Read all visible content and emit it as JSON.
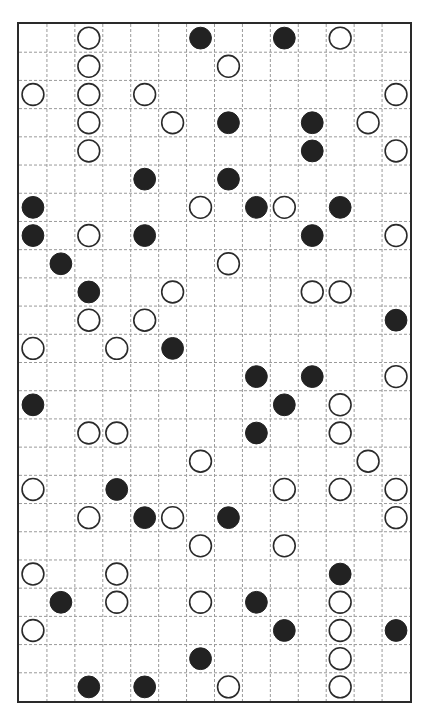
{
  "puzzle": {
    "type": "masyu",
    "rows": 24,
    "cols": 14,
    "colors": {
      "black": "#222222",
      "white": "#ffffff",
      "outline": "#2a2a2a",
      "grid": "#9a9a9a"
    },
    "circles": [
      {
        "row": 0,
        "col": 2,
        "color": "white"
      },
      {
        "row": 0,
        "col": 6,
        "color": "black"
      },
      {
        "row": 0,
        "col": 9,
        "color": "black"
      },
      {
        "row": 0,
        "col": 11,
        "color": "white"
      },
      {
        "row": 1,
        "col": 2,
        "color": "white"
      },
      {
        "row": 1,
        "col": 7,
        "color": "white"
      },
      {
        "row": 2,
        "col": 0,
        "color": "white"
      },
      {
        "row": 2,
        "col": 2,
        "color": "white"
      },
      {
        "row": 2,
        "col": 4,
        "color": "white"
      },
      {
        "row": 2,
        "col": 13,
        "color": "white"
      },
      {
        "row": 3,
        "col": 2,
        "color": "white"
      },
      {
        "row": 3,
        "col": 5,
        "color": "white"
      },
      {
        "row": 3,
        "col": 7,
        "color": "black"
      },
      {
        "row": 3,
        "col": 10,
        "color": "black"
      },
      {
        "row": 3,
        "col": 12,
        "color": "white"
      },
      {
        "row": 4,
        "col": 2,
        "color": "white"
      },
      {
        "row": 4,
        "col": 10,
        "color": "black"
      },
      {
        "row": 4,
        "col": 13,
        "color": "white"
      },
      {
        "row": 5,
        "col": 4,
        "color": "black"
      },
      {
        "row": 5,
        "col": 7,
        "color": "black"
      },
      {
        "row": 6,
        "col": 0,
        "color": "black"
      },
      {
        "row": 6,
        "col": 6,
        "color": "white"
      },
      {
        "row": 6,
        "col": 8,
        "color": "black"
      },
      {
        "row": 6,
        "col": 9,
        "color": "white"
      },
      {
        "row": 6,
        "col": 11,
        "color": "black"
      },
      {
        "row": 7,
        "col": 0,
        "color": "black"
      },
      {
        "row": 7,
        "col": 2,
        "color": "white"
      },
      {
        "row": 7,
        "col": 4,
        "color": "black"
      },
      {
        "row": 7,
        "col": 10,
        "color": "black"
      },
      {
        "row": 7,
        "col": 13,
        "color": "white"
      },
      {
        "row": 8,
        "col": 1,
        "color": "black"
      },
      {
        "row": 8,
        "col": 7,
        "color": "white"
      },
      {
        "row": 9,
        "col": 2,
        "color": "black"
      },
      {
        "row": 9,
        "col": 5,
        "color": "white"
      },
      {
        "row": 9,
        "col": 10,
        "color": "white"
      },
      {
        "row": 9,
        "col": 11,
        "color": "white"
      },
      {
        "row": 10,
        "col": 2,
        "color": "white"
      },
      {
        "row": 10,
        "col": 4,
        "color": "white"
      },
      {
        "row": 10,
        "col": 13,
        "color": "black"
      },
      {
        "row": 11,
        "col": 0,
        "color": "white"
      },
      {
        "row": 11,
        "col": 3,
        "color": "white"
      },
      {
        "row": 11,
        "col": 5,
        "color": "black"
      },
      {
        "row": 12,
        "col": 8,
        "color": "black"
      },
      {
        "row": 12,
        "col": 10,
        "color": "black"
      },
      {
        "row": 12,
        "col": 13,
        "color": "white"
      },
      {
        "row": 13,
        "col": 0,
        "color": "black"
      },
      {
        "row": 13,
        "col": 9,
        "color": "black"
      },
      {
        "row": 13,
        "col": 11,
        "color": "white"
      },
      {
        "row": 14,
        "col": 2,
        "color": "white"
      },
      {
        "row": 14,
        "col": 3,
        "color": "white"
      },
      {
        "row": 14,
        "col": 8,
        "color": "black"
      },
      {
        "row": 14,
        "col": 11,
        "color": "white"
      },
      {
        "row": 15,
        "col": 6,
        "color": "white"
      },
      {
        "row": 15,
        "col": 12,
        "color": "white"
      },
      {
        "row": 16,
        "col": 0,
        "color": "white"
      },
      {
        "row": 16,
        "col": 3,
        "color": "black"
      },
      {
        "row": 16,
        "col": 9,
        "color": "white"
      },
      {
        "row": 16,
        "col": 11,
        "color": "white"
      },
      {
        "row": 16,
        "col": 13,
        "color": "white"
      },
      {
        "row": 17,
        "col": 2,
        "color": "white"
      },
      {
        "row": 17,
        "col": 4,
        "color": "black"
      },
      {
        "row": 17,
        "col": 5,
        "color": "white"
      },
      {
        "row": 17,
        "col": 7,
        "color": "black"
      },
      {
        "row": 17,
        "col": 13,
        "color": "white"
      },
      {
        "row": 18,
        "col": 6,
        "color": "white"
      },
      {
        "row": 18,
        "col": 9,
        "color": "white"
      },
      {
        "row": 19,
        "col": 0,
        "color": "white"
      },
      {
        "row": 19,
        "col": 3,
        "color": "white"
      },
      {
        "row": 19,
        "col": 11,
        "color": "black"
      },
      {
        "row": 20,
        "col": 1,
        "color": "black"
      },
      {
        "row": 20,
        "col": 3,
        "color": "white"
      },
      {
        "row": 20,
        "col": 6,
        "color": "white"
      },
      {
        "row": 20,
        "col": 8,
        "color": "black"
      },
      {
        "row": 20,
        "col": 11,
        "color": "white"
      },
      {
        "row": 21,
        "col": 0,
        "color": "white"
      },
      {
        "row": 21,
        "col": 9,
        "color": "black"
      },
      {
        "row": 21,
        "col": 11,
        "color": "white"
      },
      {
        "row": 21,
        "col": 13,
        "color": "black"
      },
      {
        "row": 22,
        "col": 6,
        "color": "black"
      },
      {
        "row": 22,
        "col": 11,
        "color": "white"
      },
      {
        "row": 23,
        "col": 2,
        "color": "black"
      },
      {
        "row": 23,
        "col": 4,
        "color": "black"
      },
      {
        "row": 23,
        "col": 7,
        "color": "white"
      },
      {
        "row": 23,
        "col": 11,
        "color": "white"
      }
    ]
  }
}
